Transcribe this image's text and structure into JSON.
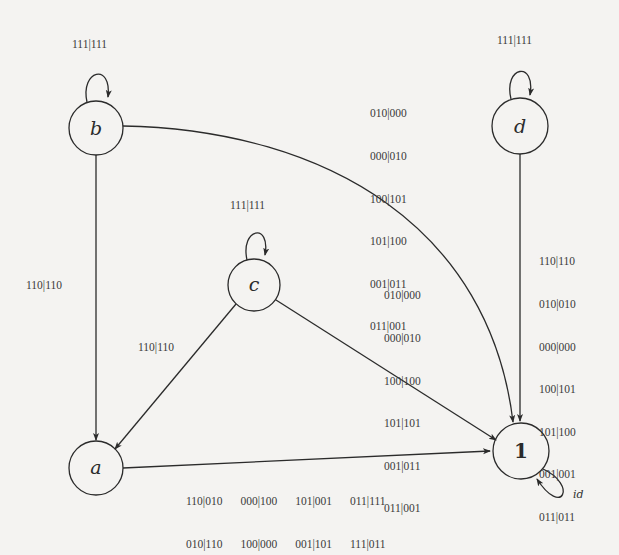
{
  "nodes": {
    "b": {
      "label": "b",
      "loop": "111|111"
    },
    "d": {
      "label": "d",
      "loop": "111|111"
    },
    "c": {
      "label": "c",
      "loop": "111|111"
    },
    "a": {
      "label": "a"
    },
    "one": {
      "label": "1",
      "loop": "id"
    }
  },
  "edges": {
    "b_to_a": {
      "label": "110|110"
    },
    "c_to_a": {
      "label": "110|110"
    },
    "b_to_one": {
      "lines": [
        "010|000",
        "000|010",
        "100|101",
        "101|100",
        "001|011",
        "011|001"
      ]
    },
    "c_to_one": {
      "lines": [
        "010|000",
        "000|010",
        "100|100",
        "101|101",
        "001|011",
        "011|001"
      ]
    },
    "d_to_one": {
      "lines": [
        "110|110",
        "010|010",
        "000|000",
        "100|101",
        "101|100",
        "001|001",
        "011|011"
      ]
    },
    "a_to_one": {
      "row1": [
        "110|010",
        "000|100",
        "101|001",
        "011|111"
      ],
      "row2": [
        "010|110",
        "100|000",
        "001|101",
        "111|011"
      ]
    }
  }
}
